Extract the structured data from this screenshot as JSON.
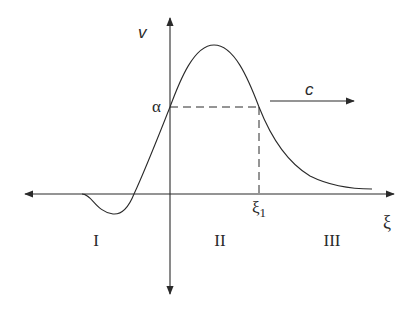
{
  "diagram": {
    "axes": {
      "vertical_label": "v",
      "horizontal_label": "ξ"
    },
    "markers": {
      "alpha_label": "α",
      "xi1_label": "ξ",
      "xi1_subscript": "1"
    },
    "wave_speed_label": "c",
    "regions": [
      {
        "label": "I"
      },
      {
        "label": "II"
      },
      {
        "label": "III"
      }
    ],
    "colors": {
      "ink": "#2a2a2a",
      "background": "#ffffff"
    }
  }
}
